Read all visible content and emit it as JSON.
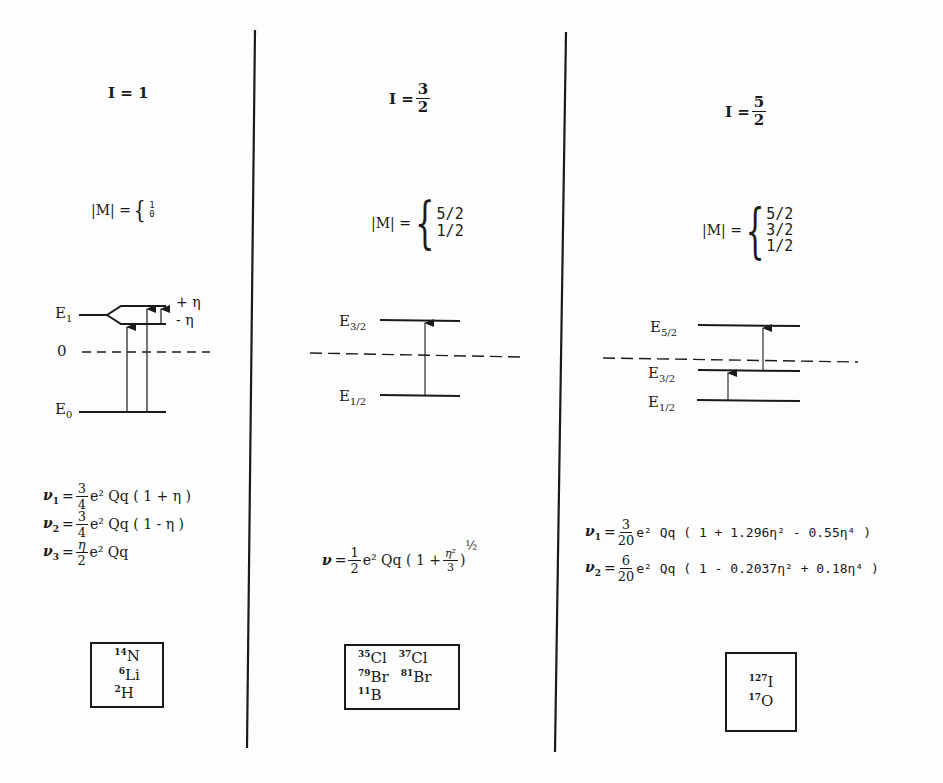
{
  "columns": [
    {
      "spin_label": "I = 1",
      "spin": {
        "prefix": "I = ",
        "value": "1"
      },
      "m_prefix": "|M| =",
      "m_values": [
        "1",
        "0"
      ],
      "levels": {
        "upper": "E",
        "upper_sub": "1",
        "zero": "0",
        "lower": "E",
        "lower_sub": "0",
        "split_plus": "+ η",
        "split_minus": "- η"
      },
      "equations": [
        {
          "nu_sub": "1",
          "coef_num": "3",
          "coef_den": "4",
          "body": "e² Qq ( 1 + η )"
        },
        {
          "nu_sub": "2",
          "coef_num": "3",
          "coef_den": "4",
          "body": "e² Qq ( 1 - η )"
        },
        {
          "nu_sub": "3",
          "coef_num": "η",
          "coef_den": "2",
          "body": "e² Qq"
        }
      ],
      "nuclei": [
        {
          "mass": "14",
          "symbol": "N"
        },
        {
          "mass": "6",
          "symbol": "Li"
        },
        {
          "mass": "2",
          "symbol": "H"
        }
      ]
    },
    {
      "spin": {
        "prefix": "I = ",
        "num": "3",
        "den": "2"
      },
      "m_prefix": "|M| =",
      "m_values": [
        "5/2",
        "1/2"
      ],
      "levels": {
        "upper": "E",
        "upper_sub": "3/2",
        "lower": "E",
        "lower_sub": "1/2"
      },
      "equation": {
        "nu": "ν",
        "coef_num": "1",
        "coef_den": "2",
        "body": "e² Qq ( 1 +",
        "inner_num": "η²",
        "inner_den": "3",
        "close": ")",
        "exponent": "½"
      },
      "nuclei": [
        {
          "mass": "35",
          "symbol": "Cl"
        },
        {
          "mass": "37",
          "symbol": "Cl"
        },
        {
          "mass": "79",
          "symbol": "Br"
        },
        {
          "mass": "81",
          "symbol": "Br"
        },
        {
          "mass": "11",
          "symbol": "B"
        }
      ]
    },
    {
      "spin": {
        "prefix": "I = ",
        "num": "5",
        "den": "2"
      },
      "m_prefix": "|M| =",
      "m_values": [
        "5/2",
        "3/2",
        "1/2"
      ],
      "levels": {
        "top": "E",
        "top_sub": "5/2",
        "mid": "E",
        "mid_sub": "3/2",
        "low": "E",
        "low_sub": "1/2"
      },
      "equations": [
        {
          "nu_sub": "1",
          "coef_num": "3",
          "coef_den": "20",
          "body": "e² Qq ( 1 + 1.296η² - 0.55η⁴ )"
        },
        {
          "nu_sub": "2",
          "coef_num": "6",
          "coef_den": "20",
          "body": "e² Qq ( 1 - 0.2037η² + 0.18η⁴ )"
        }
      ],
      "nuclei": [
        {
          "mass": "127",
          "symbol": "I"
        },
        {
          "mass": "17",
          "symbol": "O"
        }
      ]
    }
  ]
}
